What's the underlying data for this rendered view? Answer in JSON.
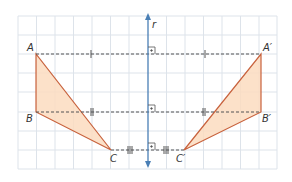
{
  "diagram": {
    "axis": {
      "label": "r",
      "color": "#4a7fb5"
    },
    "colors": {
      "grid": "#dde3ea",
      "triangle_fill": "#fbdcbf",
      "triangle_stroke": "#c8623d",
      "dashed": "#555555",
      "axis": "#4a7fb5"
    },
    "grid": {
      "x0": 18,
      "y0": 16,
      "x1": 277,
      "y1": 169,
      "cols": 14,
      "rows": 8
    },
    "points": {
      "A": {
        "label": "A",
        "x": 36,
        "y": 54
      },
      "B": {
        "label": "B",
        "x": 36,
        "y": 112
      },
      "C": {
        "label": "C",
        "x": 111,
        "y": 150
      },
      "A_prime": {
        "label": "A′",
        "x": 261,
        "y": 54
      },
      "B_prime": {
        "label": "B′",
        "x": 261,
        "y": 112
      },
      "C_prime": {
        "label": "C′",
        "x": 184,
        "y": 150
      }
    },
    "tick_marks": {
      "A_segments": "single",
      "B_segments": "double",
      "C_segments": "triple"
    }
  }
}
